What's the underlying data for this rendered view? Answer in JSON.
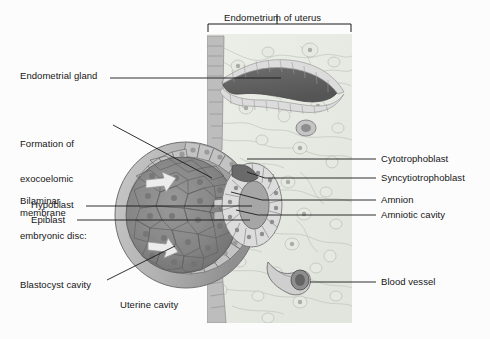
{
  "figure": {
    "background_color": "#fcfcfc",
    "text_color": "#161616",
    "leader_color": "#1a1a1a"
  },
  "bracket_label": {
    "text": "Endometrium of uterus",
    "x": 224,
    "y": 12,
    "bracket": {
      "left": 208,
      "right": 351,
      "y": 32,
      "tick_x": 277,
      "tick_top": 24,
      "arm_drop": 8
    }
  },
  "labels_left": [
    {
      "name": "endometrial-gland",
      "lines": [
        "Endometrial gland"
      ],
      "x": 20,
      "y": 70,
      "leader": "M 110 78 L 281 78"
    },
    {
      "name": "formation-of-exocoelomic-membrane",
      "lines": [
        "Formation of",
        "exocoelomic",
        "membrane"
      ],
      "x": 20,
      "y": 115,
      "leader": "M 113 125 L 212 178"
    },
    {
      "name": "bilaminar-embryonic-disc",
      "lines": [
        "Bilaminar",
        "embryonic disc:"
      ],
      "x": 20,
      "y": 172,
      "leader": ""
    },
    {
      "name": "hypoblast",
      "lines": [
        "Hypoblast"
      ],
      "x": 31,
      "y": 199,
      "leader": "M 86 206 L 252 206"
    },
    {
      "name": "epiblast",
      "lines": [
        "Epiblast"
      ],
      "x": 31,
      "y": 214,
      "leader": "M 77 220 L 250 220"
    },
    {
      "name": "blastocyst-cavity",
      "lines": [
        "Blastocyst cavity"
      ],
      "x": 20,
      "y": 279,
      "leader": "M 107 280 L 175 246"
    },
    {
      "name": "uterine-cavity",
      "lines": [
        "Uterine cavity"
      ],
      "x": 120,
      "y": 299,
      "leader": ""
    }
  ],
  "labels_right": [
    {
      "name": "cytotrophoblast",
      "lines": [
        "Cytotrophoblast"
      ],
      "x": 381,
      "y": 153,
      "leader": "M 376 159 L 247 159"
    },
    {
      "name": "syncytiotrophoblast",
      "lines": [
        "Syncytiotrophoblast"
      ],
      "x": 381,
      "y": 172,
      "leader": "M 376 178 L 265 178 L 247 172"
    },
    {
      "name": "amnion",
      "lines": [
        "Amnion"
      ],
      "x": 381,
      "y": 194,
      "leader": "M 376 200 L 262 200 L 231 192"
    },
    {
      "name": "amniotic-cavity",
      "lines": [
        "Amniotic cavity"
      ],
      "x": 381,
      "y": 209,
      "leader": "M 376 215 L 258 215 L 236 210"
    },
    {
      "name": "blood-vessel",
      "lines": [
        "Blood vessel"
      ],
      "x": 381,
      "y": 276,
      "leader": "M 376 282 L 310 282"
    }
  ],
  "illustration": {
    "panel": {
      "left": 207,
      "top": 34,
      "right": 352,
      "bottom": 323
    },
    "tissue_fill": "#e9ece6",
    "regions": [
      {
        "name": "endometrial-stroma",
        "desc": "Pale green-gray connective tissue with swirling fiber lines"
      },
      {
        "name": "endometrial-gland",
        "desc": "Dark serpentine gland lumen lined by cuboidal epithelium"
      },
      {
        "name": "uterine-epithelium",
        "desc": "Columnar surface epithelium along the left panel edge"
      },
      {
        "name": "blastocyst",
        "desc": "Large dark sphere embedded at the left of the endometrium"
      },
      {
        "name": "embryonic-disc",
        "desc": "Bilaminar disc: hypoblast and epiblast layers"
      },
      {
        "name": "amniotic-cavity",
        "desc": "Pale ring cavity right of the embryonic disc"
      },
      {
        "name": "trophoblast-shell",
        "desc": "Cytotrophoblast cells with outer syncytiotrophoblast"
      },
      {
        "name": "blood-vessel",
        "desc": "Dark-walled maternal vessel low in the stroma"
      },
      {
        "name": "exocoelomic-arrows",
        "desc": "Two pale arrows showing membrane formation"
      }
    ]
  }
}
